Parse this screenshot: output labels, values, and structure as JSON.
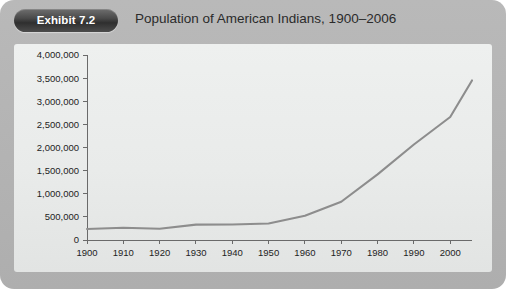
{
  "exhibit": {
    "badge_label": "Exhibit 7.2",
    "title": "Population of American Indians, 1900–2006"
  },
  "colors": {
    "card_background": "#b4b4b4",
    "plot_background": "#eceeed",
    "badge_background": "#3a3a3a",
    "badge_text": "#ffffff",
    "line": "#8d8d8d",
    "axis": "#6a6a6a",
    "text": "#232323"
  },
  "chart_data": {
    "type": "line",
    "title": "Population of American Indians, 1900–2006",
    "xlabel": "",
    "ylabel": "",
    "grid": false,
    "legend": "none",
    "xlim": [
      1900,
      2006
    ],
    "ylim": [
      0,
      4000000
    ],
    "y_ticks": [
      0,
      500000,
      1000000,
      1500000,
      2000000,
      2500000,
      3000000,
      3500000,
      4000000
    ],
    "y_tick_labels": [
      "0",
      "500,000",
      "1,000,000",
      "1,500,000",
      "2,000,000",
      "2,500,000",
      "3,000,000",
      "3,500,000",
      "4,000,000"
    ],
    "x_ticks": [
      1900,
      1910,
      1920,
      1930,
      1940,
      1950,
      1960,
      1970,
      1980,
      1990,
      2000
    ],
    "x_tick_labels": [
      "1900",
      "1910",
      "1920",
      "1930",
      "1940",
      "1950",
      "1960",
      "1970",
      "1980",
      "1990",
      "2000"
    ],
    "x": [
      1900,
      1910,
      1920,
      1930,
      1940,
      1950,
      1960,
      1970,
      1980,
      1990,
      2000,
      2006
    ],
    "values": [
      237000,
      266000,
      244000,
      332000,
      334000,
      357000,
      524000,
      827000,
      1420000,
      2065000,
      2660000,
      3450000
    ],
    "series": [
      {
        "name": "American Indian population",
        "values": [
          237000,
          266000,
          244000,
          332000,
          334000,
          357000,
          524000,
          827000,
          1420000,
          2065000,
          2660000,
          3450000
        ]
      }
    ]
  }
}
